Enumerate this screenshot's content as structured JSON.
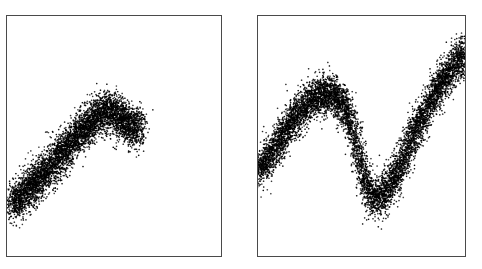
{
  "figure": {
    "title": "",
    "background_color": "#ffffff",
    "width": 482,
    "height": 269,
    "panel_border_color": "#4a4a4a",
    "point_color": "#000000"
  },
  "panels": [
    {
      "name": "left-panel",
      "label": "",
      "frame": {
        "x": 6,
        "y": 15,
        "width": 216,
        "height": 242
      }
    },
    {
      "name": "right-panel",
      "label": "",
      "frame": {
        "x": 257,
        "y": 15,
        "width": 209,
        "height": 242
      }
    }
  ],
  "chart_data": [
    {
      "type": "scatter",
      "title": "",
      "xlabel": "",
      "ylabel": "",
      "xlim": [
        0,
        1
      ],
      "ylim": [
        0,
        1
      ],
      "grid": false,
      "legend": null,
      "n_points": 5200,
      "marker_color": "#000000",
      "marker_size": 1.6,
      "noise_sigma": 0.042,
      "description": "Dense noisy point cloud following a rising curve that peaks near x=0.45 then slightly dips and flattens, terminating around x=0.63",
      "x_range_used": [
        0.02,
        0.63
      ],
      "curve_control_points": [
        {
          "x": 0.02,
          "y": 0.22
        },
        {
          "x": 0.1,
          "y": 0.28
        },
        {
          "x": 0.2,
          "y": 0.37
        },
        {
          "x": 0.3,
          "y": 0.47
        },
        {
          "x": 0.4,
          "y": 0.56
        },
        {
          "x": 0.46,
          "y": 0.6
        },
        {
          "x": 0.52,
          "y": 0.585
        },
        {
          "x": 0.57,
          "y": 0.545
        },
        {
          "x": 0.61,
          "y": 0.535
        },
        {
          "x": 0.63,
          "y": 0.545
        }
      ]
    },
    {
      "type": "scatter",
      "title": "",
      "xlabel": "",
      "ylabel": "",
      "xlim": [
        0,
        1
      ],
      "ylim": [
        0,
        1
      ],
      "grid": false,
      "legend": null,
      "n_points": 7600,
      "marker_color": "#000000",
      "marker_size": 1.6,
      "noise_sigma": 0.04,
      "description": "Dense noisy point cloud following a sinusoidal S-wave: rises from lower-left to a local maximum near x=0.38, drops to a local minimum near x=0.52, then rises steeply to the upper-right corner",
      "x_range_used": [
        0.0,
        1.0
      ],
      "curve_control_points": [
        {
          "x": 0.0,
          "y": 0.36
        },
        {
          "x": 0.08,
          "y": 0.45
        },
        {
          "x": 0.18,
          "y": 0.58
        },
        {
          "x": 0.28,
          "y": 0.66
        },
        {
          "x": 0.36,
          "y": 0.675
        },
        {
          "x": 0.43,
          "y": 0.6
        },
        {
          "x": 0.48,
          "y": 0.45
        },
        {
          "x": 0.52,
          "y": 0.3
        },
        {
          "x": 0.58,
          "y": 0.24
        },
        {
          "x": 0.66,
          "y": 0.33
        },
        {
          "x": 0.74,
          "y": 0.48
        },
        {
          "x": 0.82,
          "y": 0.62
        },
        {
          "x": 0.9,
          "y": 0.74
        },
        {
          "x": 1.0,
          "y": 0.84
        }
      ]
    }
  ]
}
